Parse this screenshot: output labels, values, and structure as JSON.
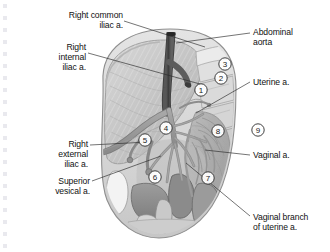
{
  "figure": {
    "type": "anatomical-illustration",
    "style": "grayscale medical illustration",
    "colors": {
      "background": "#ffffff",
      "outer_pelvis": "#dcdcdc",
      "muscle_light": "#cfcfcf",
      "muscle_mid": "#b9b9b9",
      "peritoneum": "#a9a9a9",
      "organ_dark": "#8d8d8d",
      "vessel": "#9a9a9a",
      "vessel_dark": "#4a4a4a",
      "aorta": "#3a3a3a",
      "outline": "#6e6e6e",
      "text": "#111111"
    }
  },
  "labels": [
    {
      "id": "right-common-iliac",
      "text": "Right common\niliac a.",
      "align": "right",
      "x": 28,
      "y": 10,
      "w": 95,
      "leader": [
        [
          124,
          21
        ],
        [
          205,
          47
        ]
      ]
    },
    {
      "id": "right-internal-iliac",
      "text": "Right\ninternal\niliac a.",
      "align": "right",
      "x": 20,
      "y": 42,
      "w": 66,
      "leader": [
        [
          88,
          53
        ],
        [
          200,
          84
        ]
      ]
    },
    {
      "id": "right-external-iliac",
      "text": "Right\nexternal\niliac a.",
      "align": "right",
      "x": 26,
      "y": 139,
      "w": 62,
      "leader": [
        [
          90,
          145
        ],
        [
          148,
          142
        ]
      ]
    },
    {
      "id": "superior-vesical",
      "text": "Superior\nvesical a.",
      "align": "right",
      "x": 20,
      "y": 176,
      "w": 70,
      "leader": [
        [
          92,
          181
        ],
        [
          161,
          156
        ]
      ]
    },
    {
      "id": "abdominal-aorta",
      "text": "Abdominal\naorta",
      "align": "left",
      "x": 253,
      "y": 27,
      "w": 74,
      "leader": [
        [
          250,
          33
        ],
        [
          176,
          43
        ]
      ]
    },
    {
      "id": "uterine-a",
      "text": "Uterine a.",
      "align": "left",
      "x": 253,
      "y": 77,
      "w": 70,
      "leader": [
        [
          250,
          82
        ],
        [
          196,
          113
        ]
      ]
    },
    {
      "id": "vaginal-a",
      "text": "Vaginal a.",
      "align": "left",
      "x": 253,
      "y": 150,
      "w": 70,
      "leader": [
        [
          250,
          155
        ],
        [
          205,
          150
        ]
      ]
    },
    {
      "id": "vaginal-branch-uterine",
      "text": "Vaginal branch\nof uterine a.",
      "align": "left",
      "x": 253,
      "y": 212,
      "w": 76,
      "leader": [
        [
          250,
          216
        ],
        [
          186,
          163
        ]
      ]
    }
  ],
  "markers": [
    {
      "n": "1",
      "x": 201,
      "y": 90
    },
    {
      "n": "2",
      "x": 221,
      "y": 78
    },
    {
      "n": "3",
      "x": 225,
      "y": 64
    },
    {
      "n": "4",
      "x": 166,
      "y": 128
    },
    {
      "n": "5",
      "x": 145,
      "y": 140
    },
    {
      "n": "6",
      "x": 155,
      "y": 177
    },
    {
      "n": "7",
      "x": 208,
      "y": 178
    },
    {
      "n": "8",
      "x": 218,
      "y": 131
    },
    {
      "n": "9",
      "x": 258,
      "y": 130
    }
  ]
}
